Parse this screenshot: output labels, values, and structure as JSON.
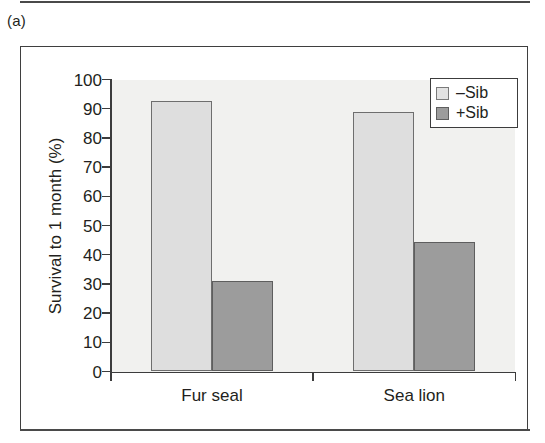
{
  "figure": {
    "panel_label": "(a)"
  },
  "chart_data": {
    "type": "bar",
    "title": "",
    "xlabel": "",
    "ylabel": "Survival to 1 month (%)",
    "categories": [
      "Fur seal",
      "Sea lion"
    ],
    "series": [
      {
        "name": "–Sib",
        "values": [
          92.5,
          89.0
        ],
        "color": "#dedede"
      },
      {
        "name": "+Sib",
        "values": [
          31.0,
          44.5
        ],
        "color": "#9c9c9c"
      }
    ],
    "ylim": [
      0,
      100
    ],
    "yticks": [
      0,
      10,
      20,
      30,
      40,
      50,
      60,
      70,
      80,
      90,
      100
    ],
    "ytick_labels": [
      "0",
      "10",
      "20",
      "30",
      "40",
      "50",
      "60",
      "70",
      "80",
      "90",
      "100"
    ],
    "grid": false,
    "legend_position": "top-right",
    "legend_entries": [
      "–Sib",
      "+Sib"
    ]
  }
}
